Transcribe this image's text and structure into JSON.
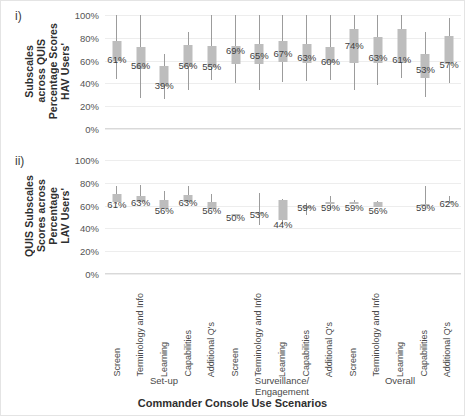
{
  "figure": {
    "x_axis_title": "Commander Console Use Scenarios",
    "panels": [
      {
        "index_label": "i)",
        "y_axis_title_lines": [
          "HAV Users'",
          "Percentage Scores",
          "across QUIS",
          "Subscales"
        ],
        "y_ticks": [
          "100%",
          "80%",
          "60%",
          "40%",
          "20%",
          "0%"
        ]
      },
      {
        "index_label": "ii)",
        "y_axis_title_lines": [
          "LAV Users'",
          "Percentage",
          "Scores across",
          "QUIS Subscales"
        ],
        "y_ticks": [
          "100%",
          "80%",
          "60%",
          "40%",
          "20%",
          "0%"
        ]
      }
    ],
    "categories": [
      "Screen",
      "Terminology and Info",
      "Learning",
      "Capabilities",
      "Additional Q's",
      "Screen",
      "Terminology and Info",
      "Learning",
      "Capabilities",
      "Additional Q's",
      "Screen",
      "Terminology and Info",
      "Learning",
      "Capabilities",
      "Additional Q's"
    ],
    "groups": [
      {
        "label": "Set-up",
        "start": 0,
        "end": 4
      },
      {
        "label": "Surveillance/ Engagement",
        "start": 5,
        "end": 9
      },
      {
        "label": "Overall",
        "start": 10,
        "end": 14
      }
    ]
  },
  "chart_data": [
    {
      "type": "box",
      "title": "HAV Users' Percentage Scores across QUIS Subscales",
      "xlabel": "Commander Console Use Scenarios",
      "ylabel": "HAV Users' Percentage Scores across QUIS Subscales",
      "ylim": [
        0,
        100
      ],
      "ytick_values": [
        0,
        20,
        40,
        60,
        80,
        100
      ],
      "grid": true,
      "legend": "none",
      "categories": [
        "Screen",
        "Terminology and Info",
        "Learning",
        "Capabilities",
        "Additional Q's",
        "Screen",
        "Terminology and Info",
        "Learning",
        "Capabilities",
        "Additional Q's",
        "Screen",
        "Terminology and Info",
        "Learning",
        "Capabilities",
        "Additional Q's"
      ],
      "boxes": [
        {
          "label": "61%",
          "median": 61,
          "q1": 60,
          "q3": 77,
          "low": 44,
          "high": 100
        },
        {
          "label": "56%",
          "median": 56,
          "q1": 53,
          "q3": 72,
          "low": 27,
          "high": 100
        },
        {
          "label": "39%",
          "median": 39,
          "q1": 38,
          "q3": 55,
          "low": 26,
          "high": 66
        },
        {
          "label": "56%",
          "median": 56,
          "q1": 54,
          "q3": 74,
          "low": 34,
          "high": 85
        },
        {
          "label": "55%",
          "median": 55,
          "q1": 54,
          "q3": 73,
          "low": 43,
          "high": 100
        },
        {
          "label": "69%",
          "median": 69,
          "q1": 57,
          "q3": 73,
          "low": 40,
          "high": 100
        },
        {
          "label": "65%",
          "median": 65,
          "q1": 57,
          "q3": 75,
          "low": 34,
          "high": 100
        },
        {
          "label": "67%",
          "median": 67,
          "q1": 59,
          "q3": 77,
          "low": 41,
          "high": 100
        },
        {
          "label": "63%",
          "median": 63,
          "q1": 58,
          "q3": 75,
          "low": 42,
          "high": 100
        },
        {
          "label": "60%",
          "median": 60,
          "q1": 58,
          "q3": 72,
          "low": 43,
          "high": 100
        },
        {
          "label": "74%",
          "median": 74,
          "q1": 58,
          "q3": 88,
          "low": 34,
          "high": 100
        },
        {
          "label": "63%",
          "median": 63,
          "q1": 58,
          "q3": 81,
          "low": 39,
          "high": 100
        },
        {
          "label": "61%",
          "median": 61,
          "q1": 58,
          "q3": 88,
          "low": 45,
          "high": 100
        },
        {
          "label": "53%",
          "median": 53,
          "q1": 45,
          "q3": 66,
          "low": 28,
          "high": 85
        },
        {
          "label": "57%",
          "median": 57,
          "q1": 57,
          "q3": 82,
          "low": 40,
          "high": 97
        }
      ]
    },
    {
      "type": "box",
      "title": "LAV Users' Percentage Scores across QUIS Subscales",
      "xlabel": "Commander Console Use Scenarios",
      "ylabel": "LAV Users' Percentage Scores across QUIS Subscales",
      "ylim": [
        0,
        100
      ],
      "ytick_values": [
        0,
        20,
        40,
        60,
        80,
        100
      ],
      "grid": true,
      "legend": "none",
      "categories": [
        "Screen",
        "Terminology and Info",
        "Learning",
        "Capabilities",
        "Additional Q's",
        "Screen",
        "Terminology and Info",
        "Learning",
        "Capabilities",
        "Additional Q's",
        "Screen",
        "Terminology and Info",
        "Learning",
        "Capabilities",
        "Additional Q's"
      ],
      "boxes": [
        {
          "label": "61%",
          "median": 61,
          "q1": 63,
          "q3": 70,
          "low": 61,
          "high": 77
        },
        {
          "label": "63%",
          "median": 63,
          "q1": 63,
          "q3": 68,
          "low": 63,
          "high": 78
        },
        {
          "label": "56%",
          "median": 56,
          "q1": 57,
          "q3": 65,
          "low": 57,
          "high": 73
        },
        {
          "label": "63%",
          "median": 63,
          "q1": 63,
          "q3": 69,
          "low": 63,
          "high": 77
        },
        {
          "label": "56%",
          "median": 56,
          "q1": 57,
          "q3": 63,
          "low": 57,
          "high": 70
        },
        {
          "label": "50%",
          "median": 50,
          "q1": 51,
          "q3": 53,
          "low": 51,
          "high": 53
        },
        {
          "label": "53%",
          "median": 53,
          "q1": 54,
          "q3": 54,
          "low": 43,
          "high": 71
        },
        {
          "label": "44%",
          "median": 44,
          "q1": 47,
          "q3": 65,
          "low": 44,
          "high": 66
        },
        {
          "label": "59%",
          "median": 59,
          "q1": 58,
          "q3": 60,
          "low": 52,
          "high": 62
        },
        {
          "label": "59%",
          "median": 59,
          "q1": 62,
          "q3": 63,
          "low": 56,
          "high": 68
        },
        {
          "label": "59%",
          "median": 59,
          "q1": 62,
          "q3": 63,
          "low": 62,
          "high": 65
        },
        {
          "label": "56%",
          "median": 56,
          "q1": 59,
          "q3": 63,
          "low": 59,
          "high": 64
        },
        {
          "label": "",
          "median": null,
          "q1": null,
          "q3": null,
          "low": null,
          "high": null
        },
        {
          "label": "59%",
          "median": 59,
          "q1": 60,
          "q3": 61,
          "low": 60,
          "high": 77
        },
        {
          "label": "62%",
          "median": 62,
          "q1": 62,
          "q3": 64,
          "low": 62,
          "high": 68
        }
      ]
    }
  ]
}
